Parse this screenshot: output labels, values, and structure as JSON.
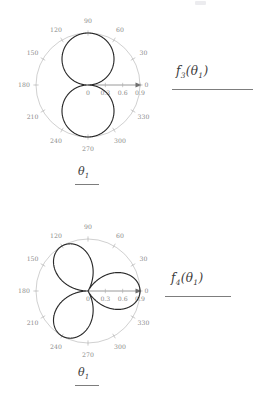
{
  "page": {
    "background_color": "#ffffff",
    "curve_color": "#2a2a2a",
    "grid_color": "#b0b0b0",
    "label_color": "#8a8a8a",
    "axis_color": "#8f8f8f"
  },
  "figures": [
    {
      "id": "figure-1",
      "function_label": "f",
      "function_sub": "3",
      "function_arg_open": "(",
      "function_arg": "θ",
      "function_arg_sub": "1",
      "function_arg_close": ")",
      "axis_label": "θ",
      "axis_label_sub": "1"
    },
    {
      "id": "figure-2",
      "function_label": "f",
      "function_sub": "4",
      "function_arg_open": "(",
      "function_arg": "θ",
      "function_arg_sub": "1",
      "function_arg_close": ")",
      "axis_label": "θ",
      "axis_label_sub": "1"
    }
  ],
  "chart_data": [
    {
      "type": "line",
      "subtype": "polar",
      "title": "",
      "xlabel": "θ₁",
      "ylabel": "f₃(θ₁)",
      "angular_unit": "degrees",
      "angular_ticks": [
        0,
        30,
        60,
        90,
        120,
        150,
        180,
        210,
        240,
        270,
        300,
        330
      ],
      "angular_tick_labels": [
        "0",
        "30",
        "60",
        "90",
        "120",
        "150",
        "180",
        "210",
        "240",
        "270",
        "300",
        "330"
      ],
      "radial_ticks": [
        0,
        0.3,
        0.6,
        0.9
      ],
      "radial_tick_labels": [
        "0",
        "0.3",
        "0.6",
        "0.9"
      ],
      "rlim": [
        0,
        0.9
      ],
      "grid": true,
      "legend": false,
      "series": [
        {
          "name": "f3",
          "description": "vertical figure-eight, two lobes along 90 and 270 degrees",
          "formula": "r = 0.9*|sin(theta)|",
          "theta_deg": [
            0,
            10,
            20,
            30,
            40,
            50,
            60,
            70,
            80,
            90,
            100,
            110,
            120,
            130,
            140,
            150,
            160,
            170,
            180,
            190,
            200,
            210,
            220,
            230,
            240,
            250,
            260,
            270,
            280,
            290,
            300,
            310,
            320,
            330,
            340,
            350,
            360
          ],
          "r": [
            0,
            0.156,
            0.308,
            0.45,
            0.579,
            0.689,
            0.779,
            0.846,
            0.886,
            0.9,
            0.886,
            0.846,
            0.779,
            0.689,
            0.579,
            0.45,
            0.308,
            0.156,
            0,
            0.156,
            0.308,
            0.45,
            0.579,
            0.689,
            0.779,
            0.846,
            0.886,
            0.9,
            0.886,
            0.846,
            0.779,
            0.689,
            0.579,
            0.45,
            0.308,
            0.156,
            0
          ]
        }
      ]
    },
    {
      "type": "line",
      "subtype": "polar",
      "title": "",
      "xlabel": "θ₁",
      "ylabel": "f₄(θ₁)",
      "angular_unit": "degrees",
      "angular_ticks": [
        0,
        30,
        60,
        90,
        120,
        150,
        180,
        210,
        240,
        270,
        300,
        330
      ],
      "angular_tick_labels": [
        "0",
        "30",
        "60",
        "90",
        "120",
        "150",
        "180",
        "210",
        "240",
        "270",
        "300",
        "330"
      ],
      "radial_ticks": [
        0,
        0.3,
        0.6,
        0.9
      ],
      "radial_tick_labels": [
        "0",
        "0.3",
        "0.6",
        "0.9"
      ],
      "rlim": [
        0,
        0.9
      ],
      "grid": true,
      "legend": false,
      "series": [
        {
          "name": "f4",
          "description": "three-petal rose with petals centered at 0, 120 and 240 degrees",
          "formula": "r = 0.9*|cos(1.5*theta)|",
          "theta_deg": [
            0,
            10,
            20,
            30,
            40,
            50,
            60,
            70,
            80,
            90,
            100,
            110,
            120,
            130,
            140,
            150,
            160,
            170,
            180,
            190,
            200,
            210,
            220,
            230,
            240,
            250,
            260,
            270,
            280,
            290,
            300,
            310,
            320,
            330,
            340,
            350,
            360
          ],
          "r": [
            0.9,
            0.869,
            0.779,
            0.636,
            0.45,
            0.233,
            0.0,
            0.233,
            0.45,
            0.636,
            0.779,
            0.869,
            0.9,
            0.869,
            0.779,
            0.636,
            0.45,
            0.233,
            0.0,
            0.233,
            0.45,
            0.636,
            0.779,
            0.869,
            0.9,
            0.869,
            0.779,
            0.636,
            0.45,
            0.233,
            0.0,
            0.233,
            0.45,
            0.636,
            0.779,
            0.869,
            0.9
          ]
        }
      ]
    }
  ]
}
